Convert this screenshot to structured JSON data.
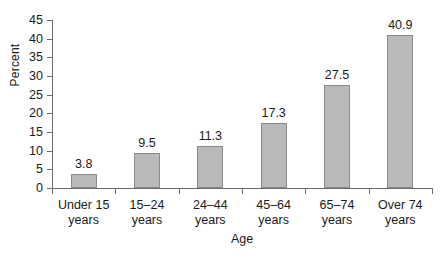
{
  "chart_data": {
    "type": "bar",
    "title": "",
    "xlabel": "Age",
    "ylabel": "Percent",
    "categories": [
      "Under 15 years",
      "15–24 years",
      "24–44 years",
      "45–64 years",
      "65–74 years",
      "Over 74 years"
    ],
    "category_lines": [
      [
        "Under 15",
        "years"
      ],
      [
        "15–24",
        "years"
      ],
      [
        "24–44",
        "years"
      ],
      [
        "45–64",
        "years"
      ],
      [
        "65–74",
        "years"
      ],
      [
        "Over 74",
        "years"
      ]
    ],
    "values": [
      3.8,
      9.5,
      11.3,
      17.3,
      27.5,
      40.9
    ],
    "value_labels": [
      "3.8",
      "9.5",
      "11.3",
      "17.3",
      "27.5",
      "40.9"
    ],
    "ylim": [
      0,
      45
    ],
    "ytick_step": 5,
    "yticks": [
      0,
      5,
      10,
      15,
      20,
      25,
      30,
      35,
      40,
      45
    ],
    "ytick_labels": [
      "0",
      "5",
      "10",
      "15",
      "20",
      "25",
      "30",
      "35",
      "40",
      "45"
    ],
    "grid": false,
    "legend": null,
    "colors": {
      "bar_fill": "#b9b9b9",
      "bar_border": "#8a8a8a",
      "axis": "#6b6b6b",
      "text": "#1a1a1a",
      "background": "#ffffff"
    }
  }
}
